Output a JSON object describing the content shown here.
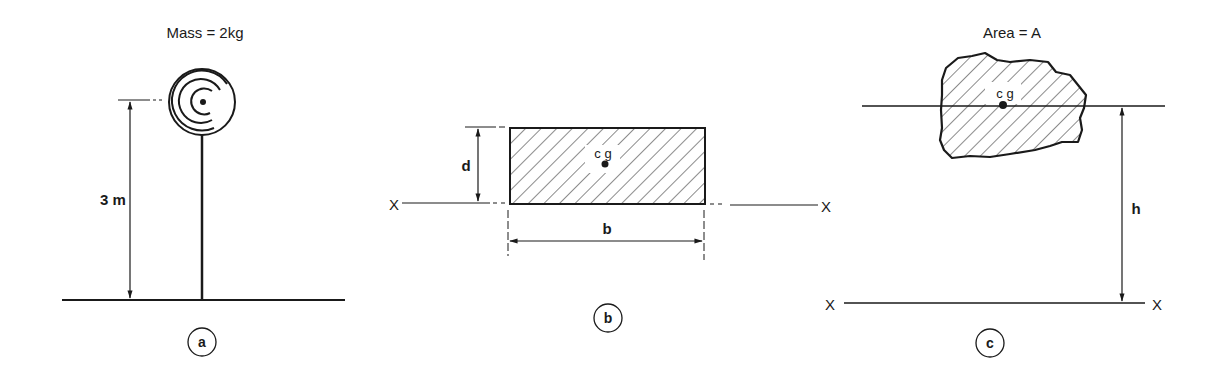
{
  "figure_a": {
    "title": "Mass = 2kg",
    "height_label": "3 m",
    "caption": "a"
  },
  "figure_b": {
    "height_label": "d",
    "width_label": "b",
    "centroid_label": "c g",
    "axis_left": "X",
    "axis_right": "X",
    "caption": "b"
  },
  "figure_c": {
    "title": "Area = A",
    "centroid_label": "c g",
    "distance_label": "h",
    "axis_left": "X",
    "axis_right": "X",
    "caption": "c"
  },
  "colors": {
    "ink": "#1a1a1a",
    "background": "#ffffff"
  }
}
